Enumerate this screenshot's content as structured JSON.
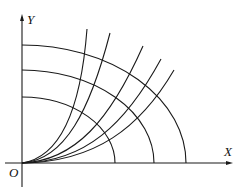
{
  "diagram": {
    "type": "orthogonal-trajectories",
    "axes": {
      "x_label": "X",
      "y_label": "Y",
      "origin_label": "O"
    },
    "ellipses": [
      {
        "name": "ellipse-inner",
        "x_intercept": 115,
        "y_intercept": 97
      },
      {
        "name": "ellipse-middle",
        "x_intercept": 154,
        "y_intercept": 70
      },
      {
        "name": "ellipse-outer",
        "x_intercept": 186,
        "y_intercept": 45
      }
    ],
    "curves": [
      {
        "name": "curve-1",
        "end": [
          87,
          29
        ]
      },
      {
        "name": "curve-2",
        "end": [
          110,
          33
        ]
      },
      {
        "name": "curve-3",
        "end": [
          143,
          46
        ]
      },
      {
        "name": "curve-4",
        "end": [
          161,
          59
        ]
      },
      {
        "name": "curve-5",
        "end": [
          174,
          70
        ]
      }
    ],
    "stroke_color": "#1a1a1a"
  }
}
